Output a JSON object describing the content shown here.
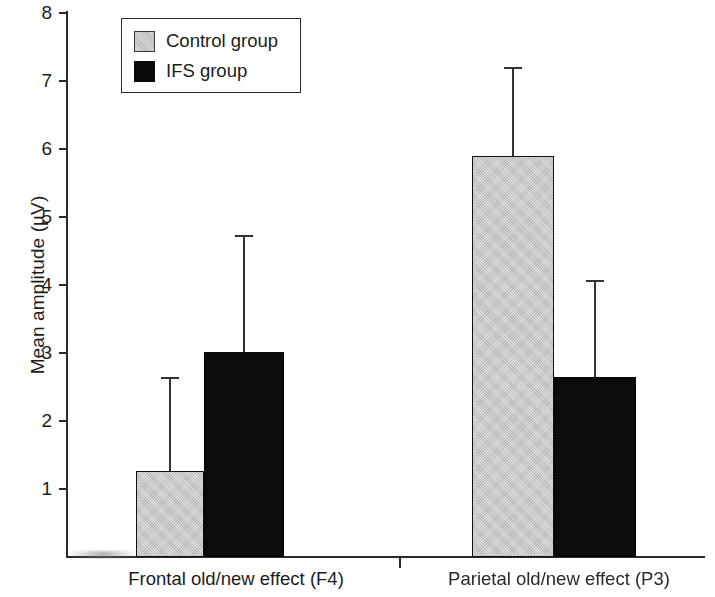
{
  "chart_data": {
    "type": "bar",
    "title": "",
    "subtitle": "",
    "xlabel": "",
    "ylabel": "Mean amplitude (µV)",
    "categories": [
      "Frontal old/new effect (F4)",
      "Parietal old/new effect (P3)"
    ],
    "series": [
      {
        "name": "Control group",
        "color": "#c3c3c3",
        "values": [
          1.27,
          5.9
        ],
        "errors": [
          1.38,
          1.3
        ],
        "error_tops": [
          2.65,
          7.2
        ]
      },
      {
        "name": "IFS group",
        "color": "#0b0b0b",
        "values": [
          3.01,
          2.65
        ],
        "errors": [
          1.73,
          1.42
        ],
        "error_tops": [
          4.74,
          4.07
        ]
      }
    ],
    "ylim": [
      0,
      8
    ],
    "yticks": [
      1,
      2,
      3,
      4,
      5,
      6,
      7,
      8
    ],
    "ytick_labels": [
      "1",
      "2",
      "3",
      "4",
      "5",
      "6",
      "7",
      "8"
    ],
    "grid": false,
    "legend_position": "top-left",
    "error_bar_style": "upper-only"
  },
  "axis": {
    "y_label": "Mean amplitude (µV)",
    "ticks": [
      {
        "label": "8",
        "value": 8
      },
      {
        "label": "7",
        "value": 7
      },
      {
        "label": "6",
        "value": 6
      },
      {
        "label": "5",
        "value": 5
      },
      {
        "label": "4",
        "value": 4
      },
      {
        "label": "3",
        "value": 3
      },
      {
        "label": "2",
        "value": 2
      },
      {
        "label": "1",
        "value": 1
      }
    ]
  },
  "legend": {
    "items": [
      {
        "label": "Control group",
        "swatch": "control"
      },
      {
        "label": "IFS group",
        "swatch": "ifs"
      }
    ]
  },
  "categories": [
    {
      "label": "Frontal old/new effect (F4)"
    },
    {
      "label": "Parietal old/new effect (P3)"
    }
  ],
  "bars": [
    {
      "name": "frontal-control",
      "group": "Frontal old/new effect (F4)",
      "series": "Control group",
      "value": 1.27,
      "error_top": 2.65
    },
    {
      "name": "frontal-ifs",
      "group": "Frontal old/new effect (F4)",
      "series": "IFS group",
      "value": 3.01,
      "error_top": 4.74
    },
    {
      "name": "parietal-control",
      "group": "Parietal old/new effect (P3)",
      "series": "Control group",
      "value": 5.9,
      "error_top": 7.2
    },
    {
      "name": "parietal-ifs",
      "group": "Parietal old/new effect (P3)",
      "series": "IFS group",
      "value": 2.65,
      "error_top": 4.07
    }
  ]
}
